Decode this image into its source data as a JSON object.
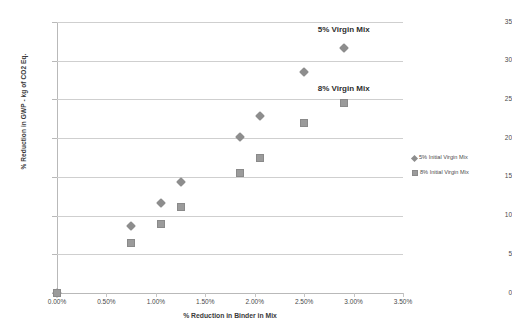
{
  "chart_data": {
    "type": "scatter",
    "title": "",
    "xlabel": "% Reduction in Binder in Mix",
    "ylabel": "% Reduction in GWP - kg of CO2 Eq.",
    "xlim": [
      0,
      3.5
    ],
    "ylim": [
      0,
      35
    ],
    "grid": true,
    "legend_position": "right",
    "x_tick_labels": [
      "0.00%",
      "0.50%",
      "1.00%",
      "1.50%",
      "2.00%",
      "2.50%",
      "3.00%",
      "3.50%"
    ],
    "x_tick_values": [
      0,
      0.5,
      1.0,
      1.5,
      2.0,
      2.5,
      3.0,
      3.5
    ],
    "y_tick_labels": [
      "0",
      "5",
      "10",
      "15",
      "20",
      "25",
      "30",
      "35"
    ],
    "y_tick_values": [
      0,
      5,
      10,
      15,
      20,
      25,
      30,
      35
    ],
    "series": [
      {
        "name": "5% Initial Virgin Mix",
        "marker": "diamond",
        "color": "#8d8d8d",
        "points": [
          {
            "x": 0.0,
            "y": 0.0
          },
          {
            "x": 0.75,
            "y": 8.6
          },
          {
            "x": 1.05,
            "y": 11.6
          },
          {
            "x": 1.25,
            "y": 14.3
          },
          {
            "x": 1.85,
            "y": 20.1
          },
          {
            "x": 2.05,
            "y": 22.8
          },
          {
            "x": 2.5,
            "y": 28.6
          },
          {
            "x": 2.9,
            "y": 31.6
          }
        ]
      },
      {
        "name": "8% Initial Virgin Mix",
        "marker": "square",
        "color": "#9b9b9b",
        "points": [
          {
            "x": 0.0,
            "y": 0.0
          },
          {
            "x": 0.75,
            "y": 6.5
          },
          {
            "x": 1.05,
            "y": 8.9
          },
          {
            "x": 1.25,
            "y": 11.1
          },
          {
            "x": 1.85,
            "y": 15.5
          },
          {
            "x": 2.05,
            "y": 17.5
          },
          {
            "x": 2.5,
            "y": 21.9
          },
          {
            "x": 2.9,
            "y": 24.5
          }
        ]
      }
    ],
    "annotations": [
      {
        "text": "5% Virgin Mix",
        "x": 2.8,
        "y": 34.0
      },
      {
        "text": "8% Virgin Mix",
        "x": 2.8,
        "y": 26.3
      }
    ]
  },
  "legend": {
    "items": [
      {
        "label": "5% Initial Virgin Mix",
        "marker": "diamond"
      },
      {
        "label": "8% Initial Virgin Mix",
        "marker": "square"
      }
    ]
  }
}
